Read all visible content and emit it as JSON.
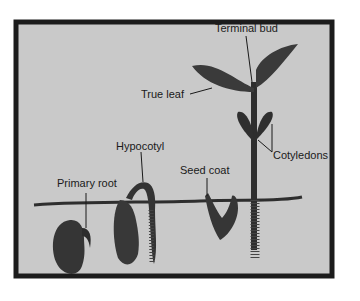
{
  "colors": {
    "panel_background": "#c9c9c9",
    "panel_border": "#1c1c1c",
    "plant": "#3a3a3a",
    "plant_dark": "#2a2a2a",
    "label_text": "#1a1a1a"
  },
  "labels": {
    "terminal_bud": "Terminal bud",
    "true_leaf": "True leaf",
    "hypocotyl": "Hypocotyl",
    "seed_coat": "Seed coat",
    "cotyledons": "Cotyledons",
    "primary_root": "Primary root"
  },
  "stages": [
    {
      "name": "seed-with-primary-root"
    },
    {
      "name": "hypocotyl-hook-emerging"
    },
    {
      "name": "seed-coat-shedding"
    },
    {
      "name": "seedling-with-true-leaves"
    }
  ]
}
